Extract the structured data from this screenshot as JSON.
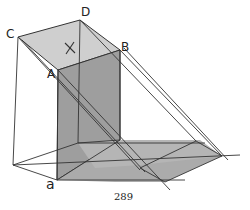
{
  "figure": {
    "type": "shadow-projection-sketch",
    "labels": {
      "C": "C",
      "D": "D",
      "B": "B",
      "A": "A",
      "a": "a",
      "x_mark": "X"
    },
    "page_number": "289",
    "colors": {
      "line": "#333333",
      "top_face": "#c9c9c9",
      "front_face": "#9a9a9a",
      "shadow": "#a8a8a8",
      "background": "#ffffff"
    }
  }
}
